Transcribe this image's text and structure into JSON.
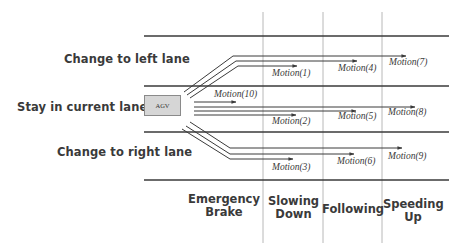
{
  "lanes": {
    "left": "Change to left lane",
    "current": "Stay in current lane",
    "right": "Change to right lane"
  },
  "agv": {
    "label": "AGV",
    "fill": "#d6d6d6"
  },
  "speeds": {
    "emergency_brake": "Emergency\nBrake",
    "slowing_down": "Slowing\nDown",
    "following": "Following",
    "speeding_up": "Speeding\nUp"
  },
  "motions": {
    "m1": "Motion(1)",
    "m2": "Motion(2)",
    "m3": "Motion(3)",
    "m4": "Motion(4)",
    "m5": "Motion(5)",
    "m6": "Motion(6)",
    "m7": "Motion(7)",
    "m8": "Motion(8)",
    "m9": "Motion(9)",
    "m10": "Motion(10)"
  },
  "colors": {
    "line": "#3a3a3a",
    "grid": "#b8b8b8"
  }
}
